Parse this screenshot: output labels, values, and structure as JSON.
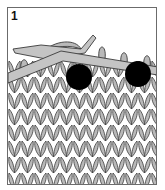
{
  "diagram": {
    "step_number": "1",
    "colors": {
      "yarn": "#b9b9b9",
      "yarn_outline": "#3a3a3a",
      "needle": "#c4c4c4",
      "marker": "#000000",
      "frame": "#6b6b6b",
      "background": "#ffffff"
    },
    "markers": [
      {
        "label": "stitch-marker-left",
        "cx": 78,
        "cy": 76,
        "r": 13
      },
      {
        "label": "stitch-marker-right",
        "cx": 137,
        "cy": 73,
        "r": 13
      }
    ]
  }
}
